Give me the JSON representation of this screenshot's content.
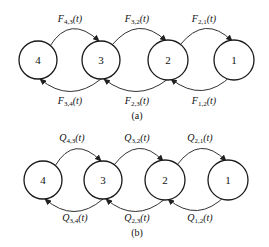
{
  "diagram_a": {
    "caption": "(a)",
    "symbol": "F",
    "nodes": [
      "4",
      "3",
      "2",
      "1"
    ],
    "top_edges": [
      {
        "from": "4",
        "to": "3",
        "sub": "4,3",
        "label": "F4,3(t)"
      },
      {
        "from": "3",
        "to": "2",
        "sub": "3,2",
        "label": "F3,2(t)"
      },
      {
        "from": "2",
        "to": "1",
        "sub": "2,1",
        "label": "F2,1(t)"
      }
    ],
    "bottom_edges": [
      {
        "from": "3",
        "to": "4",
        "sub": "3,4",
        "label": "F3,4(t)"
      },
      {
        "from": "2",
        "to": "3",
        "sub": "2,3",
        "label": "F2,3(t)"
      },
      {
        "from": "1",
        "to": "2",
        "sub": "1,2",
        "label": "F1,2(t)"
      }
    ]
  },
  "diagram_b": {
    "caption": "(b)",
    "symbol": "Q",
    "nodes": [
      "4",
      "3",
      "2",
      "1"
    ],
    "top_edges": [
      {
        "from": "4",
        "to": "3",
        "sub": "4,3",
        "label": "Q4,3(t)"
      },
      {
        "from": "3",
        "to": "2",
        "sub": "3,2",
        "label": "Q3,2(t)"
      },
      {
        "from": "2",
        "to": "1",
        "sub": "2,1",
        "label": "Q2,1(t)"
      }
    ],
    "bottom_edges": [
      {
        "from": "3",
        "to": "4",
        "sub": "3,4",
        "label": "Q3,4(t)"
      },
      {
        "from": "2",
        "to": "3",
        "sub": "2,3",
        "label": "Q2,3(t)"
      },
      {
        "from": "1",
        "to": "2",
        "sub": "1,2",
        "label": "Q1,2(t)"
      }
    ],
    "arg": "(t)"
  },
  "arg": "(t)"
}
